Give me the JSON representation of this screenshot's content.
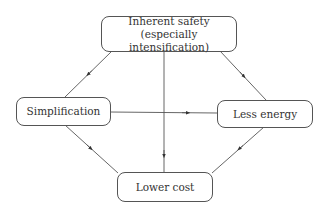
{
  "diagram": {
    "type": "flow",
    "nodes": [
      {
        "id": "inherent_safety",
        "line1": "Inherent safety",
        "line2": "(especially intensification)"
      },
      {
        "id": "simplification",
        "label": "Simplification"
      },
      {
        "id": "less_energy",
        "label": "Less energy"
      },
      {
        "id": "lower_cost",
        "label": "Lower cost"
      }
    ],
    "edges": [
      {
        "from": "inherent_safety",
        "to": "simplification"
      },
      {
        "from": "inherent_safety",
        "to": "less_energy"
      },
      {
        "from": "inherent_safety",
        "to": "lower_cost"
      },
      {
        "from": "simplification",
        "to": "less_energy"
      },
      {
        "from": "simplification",
        "to": "lower_cost"
      },
      {
        "from": "less_energy",
        "to": "lower_cost"
      }
    ],
    "colors": {
      "line": "#555555",
      "text": "#333333",
      "background": "#ffffff"
    }
  }
}
